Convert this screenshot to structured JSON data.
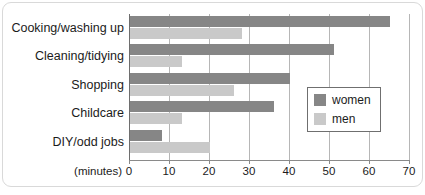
{
  "chart_data": {
    "type": "bar",
    "orientation": "horizontal",
    "title": "",
    "xlabel": "(minutes)",
    "ylabel": "",
    "xlim": [
      0,
      70
    ],
    "xticks": [
      0,
      10,
      20,
      30,
      40,
      50,
      60,
      70
    ],
    "xtick_labels": [
      "0",
      "10",
      "20",
      "30",
      "40",
      "50",
      "60",
      "70"
    ],
    "grid": "vertical",
    "legend_position": "center-right",
    "categories": [
      "Cooking/washing up",
      "Cleaning/tidying",
      "Shopping",
      "Childcare",
      "DIY/odd jobs"
    ],
    "series": [
      {
        "name": "women",
        "color": "#868686",
        "values": [
          65,
          51,
          40,
          36,
          8
        ]
      },
      {
        "name": "men",
        "color": "#c9c9c9",
        "values": [
          28,
          13,
          26,
          13,
          20
        ]
      }
    ]
  },
  "legend": {
    "items": [
      {
        "label": "women"
      },
      {
        "label": "men"
      }
    ]
  },
  "axis": {
    "units_label": "(minutes)"
  }
}
